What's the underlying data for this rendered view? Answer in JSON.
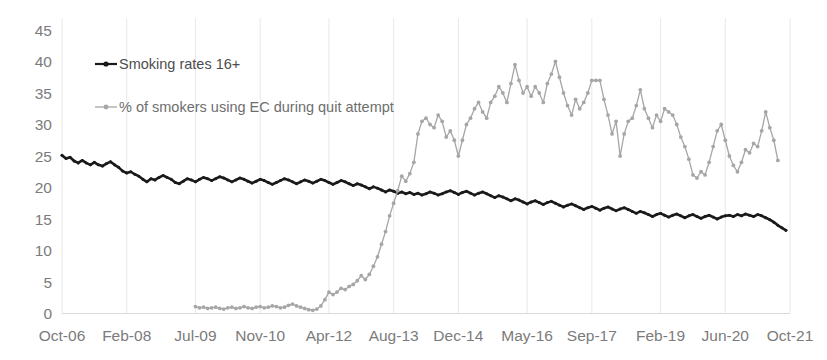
{
  "chart_data": {
    "type": "line",
    "title": "",
    "xlabel": "",
    "ylabel": "",
    "ylim": [
      0,
      45
    ],
    "yticks": [
      0,
      5,
      10,
      15,
      20,
      25,
      30,
      35,
      40,
      45
    ],
    "grid": "vertical-only",
    "legend_position": "inside-top-left",
    "x_tick_labels": [
      "Oct-06",
      "Feb-08",
      "Jul-09",
      "Nov-10",
      "Apr-12",
      "Aug-13",
      "Dec-14",
      "May-16",
      "Sep-17",
      "Feb-19",
      "Jun-20",
      "Oct-21"
    ],
    "x_tick_indices": [
      0,
      16,
      33,
      49,
      66,
      82,
      98,
      115,
      131,
      148,
      164,
      180
    ],
    "x_count": 181,
    "series": [
      {
        "name": "Smoking rates 16+",
        "color": "#1a1a1a",
        "marker": "dot",
        "start_index": 0,
        "values": [
          25.1,
          24.6,
          24.8,
          24.2,
          23.9,
          24.3,
          23.9,
          23.6,
          24.0,
          23.6,
          23.4,
          23.8,
          24.1,
          23.6,
          23.2,
          22.6,
          22.3,
          22.5,
          22.1,
          21.8,
          21.3,
          20.9,
          21.4,
          21.2,
          21.6,
          21.9,
          21.6,
          21.3,
          20.8,
          20.6,
          21.0,
          21.4,
          21.2,
          20.9,
          21.3,
          21.6,
          21.4,
          21.1,
          21.4,
          21.7,
          21.5,
          21.2,
          20.9,
          21.2,
          21.5,
          21.3,
          21.0,
          20.7,
          21.0,
          21.3,
          21.1,
          20.8,
          20.5,
          20.8,
          21.1,
          21.4,
          21.2,
          20.9,
          20.6,
          20.9,
          21.2,
          21.0,
          20.7,
          21.0,
          21.3,
          21.1,
          20.8,
          20.5,
          20.8,
          21.1,
          20.9,
          20.6,
          20.3,
          20.6,
          20.4,
          20.1,
          19.8,
          20.1,
          19.9,
          19.6,
          19.3,
          19.6,
          19.4,
          19.1,
          19.3,
          19.0,
          19.2,
          18.9,
          19.1,
          18.8,
          19.0,
          19.3,
          19.1,
          18.8,
          19.0,
          19.3,
          19.5,
          19.2,
          18.9,
          19.2,
          19.4,
          19.1,
          18.8,
          19.1,
          19.3,
          19.0,
          18.7,
          18.4,
          18.7,
          18.5,
          18.2,
          17.9,
          18.2,
          18.0,
          17.7,
          17.4,
          17.7,
          17.9,
          17.6,
          17.3,
          17.6,
          17.8,
          17.5,
          17.2,
          16.9,
          17.2,
          17.4,
          17.1,
          16.8,
          16.5,
          16.8,
          17.0,
          16.7,
          16.4,
          16.7,
          16.9,
          16.6,
          16.3,
          16.6,
          16.8,
          16.5,
          16.2,
          15.9,
          16.2,
          16.0,
          15.7,
          15.4,
          15.7,
          15.9,
          15.6,
          15.3,
          15.6,
          15.8,
          15.5,
          15.2,
          15.5,
          15.7,
          15.4,
          15.1,
          15.4,
          15.6,
          15.3,
          15.0,
          15.3,
          15.5,
          15.6,
          15.4,
          15.7,
          15.5,
          15.8,
          15.6,
          15.4,
          15.7,
          15.5,
          15.2,
          14.9,
          14.5,
          14.0,
          13.6,
          13.2
        ]
      },
      {
        "name": "% of smokers using EC during quit attempt",
        "color": "#a6a6a6",
        "marker": "dot",
        "start_index": 33,
        "values": [
          1.1,
          0.9,
          1.0,
          0.8,
          0.9,
          1.0,
          0.8,
          0.7,
          0.9,
          1.0,
          0.8,
          0.9,
          1.1,
          0.9,
          0.8,
          1.0,
          1.1,
          0.9,
          1.0,
          1.2,
          1.1,
          0.9,
          1.0,
          1.3,
          1.5,
          1.2,
          1.0,
          0.8,
          0.6,
          0.5,
          0.7,
          1.2,
          2.2,
          3.4,
          3.0,
          3.4,
          4.0,
          3.8,
          4.3,
          4.6,
          5.2,
          6.0,
          5.4,
          6.2,
          7.5,
          9.0,
          11.0,
          13.0,
          15.5,
          17.5,
          19.5,
          21.8,
          21.0,
          22.2,
          24.0,
          28.5,
          30.5,
          31.0,
          30.0,
          29.5,
          31.5,
          30.5,
          28.0,
          29.0,
          27.5,
          25.0,
          27.5,
          30.0,
          31.0,
          32.5,
          33.5,
          32.0,
          31.0,
          33.5,
          34.5,
          36.0,
          35.0,
          33.5,
          36.5,
          39.5,
          37.0,
          35.0,
          36.0,
          34.5,
          36.0,
          35.0,
          33.5,
          36.5,
          38.0,
          40.0,
          37.5,
          35.0,
          33.0,
          31.5,
          34.0,
          32.5,
          33.5,
          35.0,
          37.0,
          37.0,
          37.0,
          34.0,
          31.5,
          28.5,
          30.5,
          25.0,
          28.5,
          30.5,
          31.0,
          33.0,
          35.5,
          32.5,
          31.0,
          29.5,
          31.5,
          30.5,
          32.5,
          32.0,
          31.5,
          30.0,
          28.0,
          26.5,
          24.5,
          22.0,
          21.5,
          22.5,
          22.0,
          24.0,
          26.5,
          29.0,
          30.0,
          27.5,
          25.0,
          23.5,
          22.5,
          24.0,
          26.0,
          25.5,
          27.0,
          26.5,
          29.0,
          32.0,
          29.5,
          27.5,
          24.3
        ]
      }
    ],
    "legend": [
      {
        "label": "Smoking rates 16+",
        "color": "#1a1a1a"
      },
      {
        "label": "% of smokers using EC during quit attempt",
        "color": "#a6a6a6"
      }
    ]
  }
}
